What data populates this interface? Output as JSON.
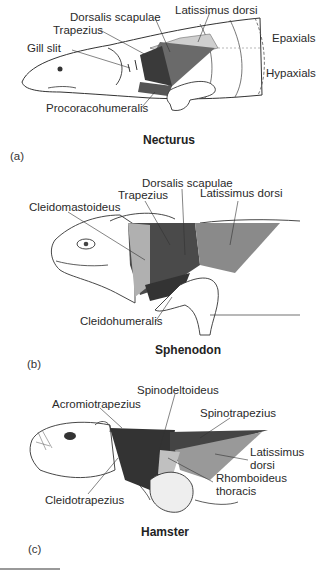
{
  "figure": {
    "panels": [
      {
        "id": "a",
        "panel_label": "(a)",
        "title": "Necturus",
        "labels": {
          "dorsalis_scapulae": "Dorsalis scapulae",
          "latissimus_dorsi": "Latissimus dorsi",
          "trapezius": "Trapezius",
          "gill_slit": "Gill slit",
          "epaxials": "Epaxials",
          "hypaxials": "Hypaxials",
          "procoracohumeralis": "Procoracohumeralis"
        }
      },
      {
        "id": "b",
        "panel_label": "(b)",
        "title": "Sphenodon",
        "labels": {
          "dorsalis_scapulae": "Dorsalis scapulae",
          "trapezius": "Trapezius",
          "latissimus_dorsi": "Latissimus dorsi",
          "cleidomastoideus": "Cleidomastoideus",
          "cleidohumeralis": "Cleidohumeralis"
        }
      },
      {
        "id": "c",
        "panel_label": "(c)",
        "title": "Hamster",
        "labels": {
          "spinodeltoideus": "Spinodeltoideus",
          "acromiotrapezius": "Acromiotrapezius",
          "spinotrapezius": "Spinotrapezius",
          "latissimus_dorsi_line1": "Latissimus",
          "latissimus_dorsi_line2": "dorsi",
          "rhomboideus_line1": "Rhomboideus",
          "rhomboideus_line2": "thoracis",
          "cleidotrapezius": "Cleidotrapezius"
        }
      }
    ],
    "colors": {
      "ink": "#2a2a2a",
      "dark_muscle": "#3a3a3a",
      "mid_muscle": "#7a7a7a",
      "light_muscle": "#b5b5b5"
    }
  }
}
